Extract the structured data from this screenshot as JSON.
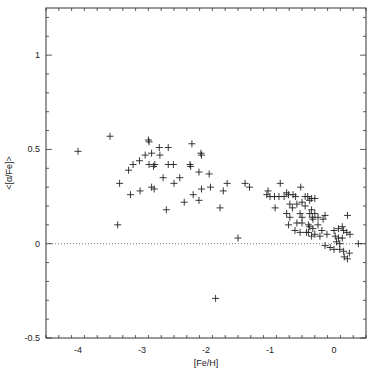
{
  "chart_data": {
    "type": "scatter",
    "title": "",
    "xlabel": "[Fe/H]",
    "ylabel": "<[α/Fe]>",
    "xlim": [
      -4.5,
      0.5
    ],
    "ylim": [
      -0.5,
      1.25
    ],
    "xticks": [
      -4,
      -3,
      -2,
      -1,
      0
    ],
    "yticks": [
      -0.5,
      0,
      0.5,
      1
    ],
    "xtick_labels": [
      "-4",
      "-3",
      "-2",
      "-1",
      "0"
    ],
    "ytick_labels": [
      "-0.5",
      "0",
      "0.5",
      "1"
    ],
    "grid": false,
    "legend": null,
    "marker": "+",
    "reference_line": {
      "y": 0,
      "style": "dotted"
    },
    "series": [
      {
        "name": "stars",
        "points": [
          [
            -4.0,
            0.49
          ],
          [
            -3.5,
            0.57
          ],
          [
            -3.38,
            0.1
          ],
          [
            -3.35,
            0.32
          ],
          [
            -3.21,
            0.39
          ],
          [
            -3.18,
            0.26
          ],
          [
            -3.14,
            0.42
          ],
          [
            -3.04,
            0.44
          ],
          [
            -3.03,
            0.28
          ],
          [
            -2.95,
            0.47
          ],
          [
            -2.9,
            0.55
          ],
          [
            -2.89,
            0.54
          ],
          [
            -2.89,
            0.42
          ],
          [
            -2.85,
            0.48
          ],
          [
            -2.85,
            0.3
          ],
          [
            -2.82,
            0.41
          ],
          [
            -2.81,
            0.29
          ],
          [
            -2.8,
            0.42
          ],
          [
            -2.73,
            0.51
          ],
          [
            -2.72,
            0.47
          ],
          [
            -2.67,
            0.35
          ],
          [
            -2.62,
            0.18
          ],
          [
            -2.59,
            0.51
          ],
          [
            -2.59,
            0.42
          ],
          [
            -2.51,
            0.42
          ],
          [
            -2.5,
            0.32
          ],
          [
            -2.41,
            0.35
          ],
          [
            -2.34,
            0.22
          ],
          [
            -2.25,
            0.42
          ],
          [
            -2.24,
            0.41
          ],
          [
            -2.22,
            0.53
          ],
          [
            -2.2,
            0.26
          ],
          [
            -2.11,
            0.38
          ],
          [
            -2.11,
            0.23
          ],
          [
            -2.08,
            0.48
          ],
          [
            -2.07,
            0.47
          ],
          [
            -2.07,
            0.29
          ],
          [
            -1.95,
            0.37
          ],
          [
            -1.93,
            0.3
          ],
          [
            -1.85,
            -0.29
          ],
          [
            -1.78,
            0.19
          ],
          [
            -1.73,
            0.28
          ],
          [
            -1.67,
            0.32
          ],
          [
            -1.5,
            0.03
          ],
          [
            -1.39,
            0.32
          ],
          [
            -1.32,
            0.3
          ],
          [
            -1.05,
            0.26
          ],
          [
            -1.03,
            0.28
          ],
          [
            -1.0,
            0.25
          ],
          [
            -0.93,
            0.25
          ],
          [
            -0.92,
            0.19
          ],
          [
            -0.86,
            0.25
          ],
          [
            -0.84,
            0.32
          ],
          [
            -0.78,
            0.25
          ],
          [
            -0.74,
            0.27
          ],
          [
            -0.74,
            0.16
          ],
          [
            -0.71,
            0.26
          ],
          [
            -0.71,
            0.1
          ],
          [
            -0.69,
            0.21
          ],
          [
            -0.69,
            0.14
          ],
          [
            -0.65,
            0.19
          ],
          [
            -0.64,
            0.26
          ],
          [
            -0.61,
            0.07
          ],
          [
            -0.6,
            0.25
          ],
          [
            -0.58,
            0.21
          ],
          [
            -0.58,
            0.11
          ],
          [
            -0.53,
            0.16
          ],
          [
            -0.53,
            0.06
          ],
          [
            -0.52,
            0.3
          ],
          [
            -0.5,
            0.22
          ],
          [
            -0.5,
            0.14
          ],
          [
            -0.5,
            0.11
          ],
          [
            -0.45,
            0.25
          ],
          [
            -0.45,
            0.2
          ],
          [
            -0.43,
            0.06
          ],
          [
            -0.41,
            0.25
          ],
          [
            -0.4,
            0.1
          ],
          [
            -0.4,
            0.06
          ],
          [
            -0.38,
            0.23
          ],
          [
            -0.38,
            0.16
          ],
          [
            -0.38,
            0.09
          ],
          [
            -0.35,
            0.24
          ],
          [
            -0.35,
            0.18
          ],
          [
            -0.35,
            0.04
          ],
          [
            -0.34,
            0.14
          ],
          [
            -0.33,
            0.13
          ],
          [
            -0.33,
            0.08
          ],
          [
            -0.3,
            0.24
          ],
          [
            -0.3,
            0.16
          ],
          [
            -0.3,
            0.05
          ],
          [
            -0.25,
            0.14
          ],
          [
            -0.25,
            0.1
          ],
          [
            -0.22,
            0.04
          ],
          [
            -0.19,
            0.07
          ],
          [
            -0.17,
            0.13
          ],
          [
            -0.14,
            0.15
          ],
          [
            -0.14,
            -0.01
          ],
          [
            -0.11,
            0.05
          ],
          [
            -0.06,
            -0.02
          ],
          [
            0.0,
            0.07
          ],
          [
            0.0,
            -0.03
          ],
          [
            0.02,
            0.04
          ],
          [
            0.04,
            0.01
          ],
          [
            0.07,
            0.08
          ],
          [
            0.07,
            0.03
          ],
          [
            0.09,
            0.0
          ],
          [
            0.09,
            -0.03
          ],
          [
            0.13,
            0.09
          ],
          [
            0.13,
            0.03
          ],
          [
            0.15,
            0.07
          ],
          [
            0.15,
            -0.04
          ],
          [
            0.16,
            -0.07
          ],
          [
            0.2,
            0.06
          ],
          [
            0.21,
            0.15
          ],
          [
            0.21,
            -0.08
          ],
          [
            0.24,
            -0.05
          ],
          [
            0.25,
            0.05
          ],
          [
            0.38,
            0.0
          ]
        ]
      }
    ]
  },
  "style": {
    "axis_color": "#333333",
    "marker_color": "#222222",
    "refline_color": "#555555",
    "background": "#ffffff"
  }
}
